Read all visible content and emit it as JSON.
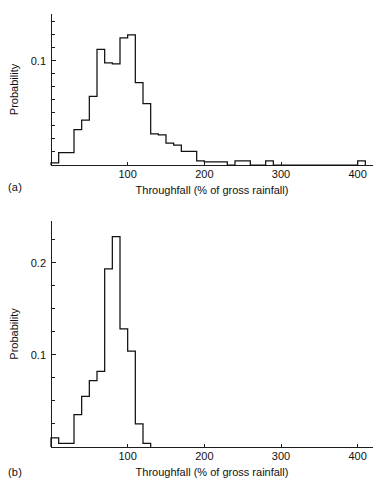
{
  "figure": {
    "panel_a_label": "(a)",
    "panel_b_label": "(b)"
  },
  "chart_data": [
    {
      "type": "bar",
      "panel": "(a)",
      "title": "",
      "xlabel": "Throughfall (% of gross rainfall)",
      "ylabel": "Probability",
      "xlim": [
        0,
        420
      ],
      "ylim": [
        0,
        0.145
      ],
      "xticks": [
        100,
        200,
        300,
        400
      ],
      "xtick_labels": [
        "100",
        "200",
        "300",
        "400"
      ],
      "yticks": [
        0.0125,
        0.025,
        0.0375,
        0.05,
        0.0625,
        0.075,
        0.0875,
        0.1,
        0.1125,
        0.125,
        0.1375
      ],
      "ytick_labels": [
        {
          "value": 0.1,
          "label": "0.1"
        }
      ],
      "grid": false,
      "legend": "none",
      "bin_width": 10,
      "bin_edges": [
        0,
        10,
        20,
        30,
        40,
        50,
        60,
        70,
        80,
        90,
        100,
        110,
        120,
        130,
        140,
        150,
        160,
        170,
        180,
        190,
        200,
        210,
        220,
        230,
        240,
        250,
        260,
        270,
        280,
        290,
        300,
        310,
        320,
        330,
        340,
        350,
        360,
        370,
        380,
        390,
        400,
        410
      ],
      "categories": [
        "0-10",
        "10-20",
        "20-30",
        "30-40",
        "40-50",
        "50-60",
        "60-70",
        "70-80",
        "80-90",
        "90-100",
        "100-110",
        "110-120",
        "120-130",
        "130-140",
        "140-150",
        "150-160",
        "160-170",
        "170-180",
        "180-190",
        "190-200",
        "200-210",
        "210-220",
        "220-230",
        "230-240",
        "240-250",
        "250-260",
        "260-270",
        "270-280",
        "280-290",
        "290-300",
        "300-310",
        "310-320",
        "320-330",
        "330-340",
        "340-350",
        "350-360",
        "360-370",
        "370-380",
        "380-390",
        "390-400",
        "400-410"
      ],
      "values": [
        0.002,
        0.012,
        0.012,
        0.034,
        0.043,
        0.066,
        0.111,
        0.098,
        0.097,
        0.122,
        0.125,
        0.079,
        0.059,
        0.03,
        0.029,
        0.021,
        0.019,
        0.013,
        0.013,
        0.004,
        0.003,
        0.003,
        0.003,
        0.0,
        0.004,
        0.004,
        0.0,
        0.0,
        0.004,
        0.0,
        0.0,
        0.0,
        0.0,
        0.0,
        0.0,
        0.0,
        0.0,
        0.0,
        0.0,
        0.0,
        0.004
      ]
    },
    {
      "type": "bar",
      "panel": "(b)",
      "title": "",
      "xlabel": "Throughfall (% of gross rainfall)",
      "ylabel": "Probability",
      "xlim": [
        0,
        420
      ],
      "ylim": [
        0,
        0.245
      ],
      "xticks": [
        100,
        200,
        300,
        400
      ],
      "xtick_labels": [
        "100",
        "200",
        "300",
        "400"
      ],
      "yticks": [
        0.025,
        0.05,
        0.075,
        0.1,
        0.125,
        0.15,
        0.175,
        0.2,
        0.225
      ],
      "ytick_labels": [
        {
          "value": 0.1,
          "label": "0.1"
        },
        {
          "value": 0.2,
          "label": "0.2"
        }
      ],
      "grid": false,
      "legend": "none",
      "bin_width": 10,
      "bin_edges": [
        0,
        10,
        20,
        30,
        40,
        50,
        60,
        70,
        80,
        90,
        100,
        110,
        120,
        130
      ],
      "categories": [
        "0-10",
        "10-20",
        "20-30",
        "30-40",
        "40-50",
        "50-60",
        "60-70",
        "70-80",
        "80-90",
        "90-100",
        "100-110",
        "110-120",
        "120-130"
      ],
      "values": [
        0.01,
        0.004,
        0.004,
        0.035,
        0.055,
        0.072,
        0.082,
        0.193,
        0.228,
        0.128,
        0.104,
        0.025,
        0.004
      ]
    }
  ]
}
